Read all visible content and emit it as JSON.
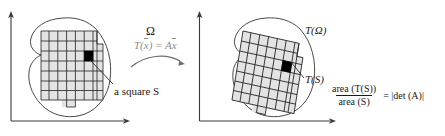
{
  "figure": {
    "colors": {
      "axis": "#3a3a3a",
      "outline": "#4a4a4a",
      "grid_line": "#2b2b2b",
      "grid_fill": "#e3e3e3",
      "square_fill": "#000000",
      "map_label": "#8e8e8e",
      "text": "#1a1a1a",
      "background": "#ffffff"
    },
    "left_panel": {
      "region_label": "Ω",
      "square_label": "a square S",
      "axes": {
        "x_axis": "x-axis-arrow",
        "y_axis": "y-axis-arrow"
      },
      "grid_rows": 7,
      "grid_cols": 7,
      "highlight_cell": {
        "row": 3,
        "col": 5
      }
    },
    "map": {
      "label_prefix": "T(",
      "label_var": "x",
      "label_mid": ") = A",
      "label_var2": "x",
      "label_full": "T(x̅) = Ax̅",
      "arrow": "curved-arrow-right"
    },
    "right_panel": {
      "region_label": "T(Ω)",
      "square_label": "T(S)",
      "axes": {
        "x_axis": "x-axis-arrow",
        "y_axis": "y-axis-arrow"
      },
      "grid_rows": 7,
      "grid_cols": 7,
      "highlight_cell": {
        "row": 3,
        "col": 5
      }
    },
    "formula": {
      "numerator": "area (T(S))",
      "denominator": "area (S)",
      "equals": "= |det (A)|"
    }
  }
}
